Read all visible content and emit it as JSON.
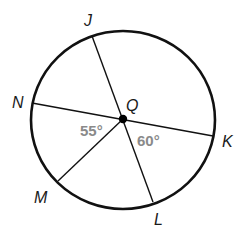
{
  "diagram": {
    "type": "circle-geometry",
    "center": {
      "label": "Q",
      "x": 123,
      "y": 119
    },
    "circle": {
      "cx": 123,
      "cy": 120,
      "rx": 92,
      "ry": 89,
      "stroke": "#111111"
    },
    "points": [
      {
        "label": "J",
        "x": 92,
        "y": 36,
        "label_x": 84,
        "label_y": 26
      },
      {
        "label": "N",
        "x": 32,
        "y": 103,
        "label_x": 12,
        "label_y": 108
      },
      {
        "label": "K",
        "x": 213,
        "y": 136,
        "label_x": 222,
        "label_y": 147
      },
      {
        "label": "M",
        "x": 58,
        "y": 181,
        "label_x": 35,
        "label_y": 203
      },
      {
        "label": "L",
        "x": 153,
        "y": 202,
        "label_x": 154,
        "label_y": 224
      }
    ],
    "segments": [
      {
        "from": "J",
        "to": "L",
        "name": "diameter-JL"
      },
      {
        "from": "N",
        "to": "K",
        "name": "diameter-NK"
      },
      {
        "from": "Q",
        "to": "M",
        "name": "radius-QM"
      }
    ],
    "angles": [
      {
        "text": "55°",
        "between": [
          "N",
          "M"
        ],
        "x": 80,
        "y": 136
      },
      {
        "text": "60°",
        "between": [
          "K",
          "L"
        ],
        "x": 137,
        "y": 146
      }
    ],
    "colors": {
      "line": "#111111",
      "angle_text": "#8a8a8a",
      "label_text": "#1a1a1a"
    }
  },
  "labels": {
    "J": "J",
    "N": "N",
    "Q": "Q",
    "K": "K",
    "M": "M",
    "L": "L",
    "angle_NQM": "55°",
    "angle_KQL": "60°"
  }
}
